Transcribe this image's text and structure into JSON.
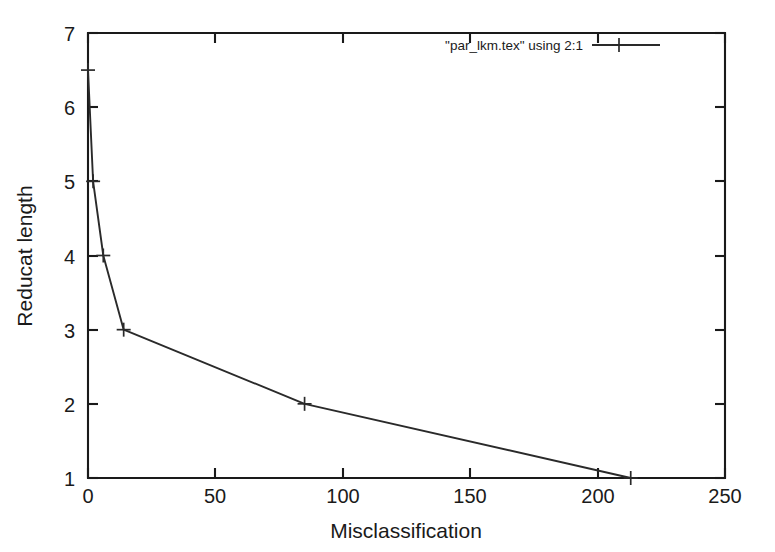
{
  "chart_data": {
    "type": "line",
    "title": "",
    "subtitle": "",
    "xlabel": "Misclassification",
    "ylabel": "Reducat length",
    "xlim": [
      0,
      250
    ],
    "ylim": [
      1,
      7
    ],
    "xticks": [
      0,
      50,
      100,
      150,
      200,
      250
    ],
    "yticks": [
      1,
      2,
      3,
      4,
      5,
      6,
      7
    ],
    "xtick_labels": [
      "0",
      "50",
      "100",
      "150",
      "200",
      "250"
    ],
    "ytick_labels": [
      "1",
      "2",
      "3",
      "4",
      "5",
      "6",
      "7"
    ],
    "grid": false,
    "legend_position": "top-right",
    "marker": "plus",
    "line_color": "#2a2a2a",
    "axis_color": "#1a1a1a",
    "background": "#ffffff",
    "series": [
      {
        "name": "\"par_lkm.tex\" using 2:1",
        "x": [
          0,
          2,
          6,
          14,
          85,
          213
        ],
        "y": [
          6.5,
          5,
          4,
          3,
          2,
          1
        ],
        "points": [
          {
            "x": 0,
            "y": 6.5
          },
          {
            "x": 2,
            "y": 5
          },
          {
            "x": 6,
            "y": 4
          },
          {
            "x": 14,
            "y": 3
          },
          {
            "x": 85,
            "y": 2
          },
          {
            "x": 213,
            "y": 1
          }
        ]
      }
    ]
  },
  "legend": {
    "entries": [
      {
        "label": "\"par_lkm.tex\" using 2:1",
        "marker": "plus"
      }
    ]
  },
  "axes": {
    "x": {
      "title": "Misclassification",
      "ticks": [
        "0",
        "50",
        "100",
        "150",
        "200",
        "250"
      ]
    },
    "y": {
      "title": "Reducat length",
      "ticks": [
        "1",
        "2",
        "3",
        "4",
        "5",
        "6",
        "7"
      ]
    }
  }
}
